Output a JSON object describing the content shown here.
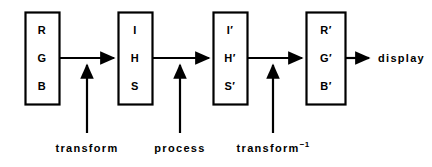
{
  "diagram": {
    "stroke_color": "#000000",
    "background_color": "#ffffff",
    "boxes": [
      {
        "id": "rgb-box",
        "x": 25,
        "y": 12,
        "w": 34,
        "h": 92,
        "channels": [
          {
            "label": "R",
            "cy": 30
          },
          {
            "label": "G",
            "cy": 58
          },
          {
            "label": "B",
            "cy": 86
          }
        ]
      },
      {
        "id": "ihs-box",
        "x": 118,
        "y": 12,
        "w": 34,
        "h": 92,
        "channels": [
          {
            "label": "I",
            "cy": 30
          },
          {
            "label": "H",
            "cy": 58
          },
          {
            "label": "S",
            "cy": 86
          }
        ]
      },
      {
        "id": "ihs-prime-box",
        "x": 213,
        "y": 12,
        "w": 34,
        "h": 92,
        "channels": [
          {
            "label": "I",
            "prime": "′",
            "cy": 30
          },
          {
            "label": "H",
            "prime": "′",
            "cy": 58
          },
          {
            "label": "S",
            "prime": "′",
            "cy": 86
          }
        ]
      },
      {
        "id": "rgb-prime-box",
        "x": 306,
        "y": 12,
        "w": 39,
        "h": 92,
        "channels": [
          {
            "label": "R",
            "prime": "′",
            "cy": 30
          },
          {
            "label": "G",
            "prime": "′",
            "cy": 58
          },
          {
            "label": "B",
            "prime": "′",
            "cy": 86
          }
        ]
      }
    ],
    "flow_arrows": [
      {
        "id": "arrow-rgb-to-ihs",
        "x1": 59,
        "x2": 117,
        "y": 58
      },
      {
        "id": "arrow-ihs-to-ihsprime",
        "x1": 152,
        "x2": 212,
        "y": 58
      },
      {
        "id": "arrow-ihsprime-to-rgbprime",
        "x1": 247,
        "x2": 305,
        "y": 58
      },
      {
        "id": "arrow-rgbprime-to-display",
        "x1": 345,
        "x2": 372,
        "y": 58
      }
    ],
    "input_stems": [
      {
        "id": "transform-stem",
        "x": 87,
        "y_bottom": 133,
        "y_top": 62,
        "label": "transform",
        "label_y": 142
      },
      {
        "id": "process-stem",
        "x": 180,
        "y_bottom": 133,
        "y_top": 62,
        "label": "process",
        "label_y": 142
      },
      {
        "id": "inverse-transform-stem",
        "x": 273,
        "y_bottom": 133,
        "y_top": 62,
        "label": "transform",
        "superscript": "−1",
        "label_y": 142
      }
    ],
    "output": {
      "id": "display-output",
      "label": "display",
      "x": 378,
      "y": 58
    }
  }
}
